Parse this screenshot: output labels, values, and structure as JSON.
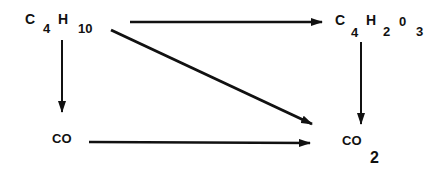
{
  "nodes": {
    "butane": {
      "parts": [
        "C",
        "4",
        "H",
        "10"
      ]
    },
    "maleic_anhydride": {
      "parts": [
        "C",
        "4",
        "H",
        "2",
        "0",
        "3"
      ]
    },
    "co": {
      "label": "CO"
    },
    "co2": {
      "label": "CO",
      "subscript": "2"
    }
  },
  "edges": [
    {
      "from": "C4H10",
      "to": "C4H2O3"
    },
    {
      "from": "C4H10",
      "to": "CO"
    },
    {
      "from": "C4H10",
      "to": "CO2"
    },
    {
      "from": "C4H2O3",
      "to": "CO2"
    },
    {
      "from": "CO",
      "to": "CO2"
    }
  ],
  "colors": {
    "ink": "#111111",
    "background": "#ffffff"
  }
}
